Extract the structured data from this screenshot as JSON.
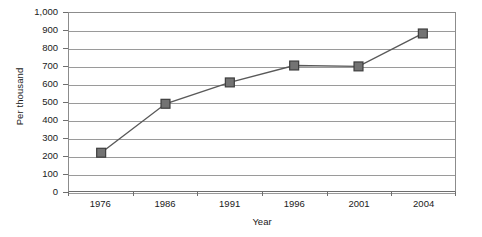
{
  "chart_data": {
    "type": "line",
    "title": "",
    "subtitle": "",
    "xlabel": "Year",
    "ylabel": "Per thousand",
    "categories": [
      "1976",
      "1986",
      "1991",
      "1996",
      "2001",
      "2004"
    ],
    "values": [
      215,
      490,
      610,
      705,
      700,
      885
    ],
    "series": [
      {
        "name": "Per thousand",
        "values": [
          215,
          490,
          610,
          705,
          700,
          885
        ],
        "marker": "square",
        "marker_color": "#737373",
        "marker_border_color": "#3d3d3d",
        "line_color": "#595959"
      }
    ],
    "ylim": [
      0,
      1000
    ],
    "ytick_step": 100,
    "ytick_labels": [
      "0",
      "100",
      "200",
      "300",
      "400",
      "500",
      "600",
      "700",
      "800",
      "900",
      "1,000"
    ],
    "ytick_values": [
      0,
      100,
      200,
      300,
      400,
      500,
      600,
      700,
      800,
      900,
      1000
    ],
    "grid": true,
    "grid_axis": "y",
    "gridline_color": "#9a9a9a",
    "legend": false,
    "legend_position": "none",
    "plot_border_color": "#8c8c8c",
    "background_color": "#ffffff",
    "annotations": []
  }
}
